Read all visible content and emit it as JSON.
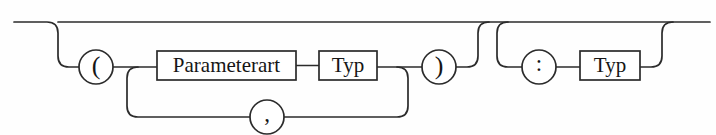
{
  "diagram": {
    "kind": "railroad-syntax-diagram",
    "language": "de",
    "ink_color": "#2b2b2b",
    "background_color": "#fefefe",
    "nodes": [
      {
        "id": "open-paren",
        "shape": "circle",
        "type": "terminal",
        "label": "(",
        "cx": 96,
        "cy": 67,
        "r": 17
      },
      {
        "id": "parameterart",
        "shape": "box",
        "type": "nonterminal",
        "label": "Parameterart",
        "x": 157,
        "y": 51,
        "width": 139,
        "height": 29
      },
      {
        "id": "typ-param",
        "shape": "box",
        "type": "nonterminal",
        "label": "Typ",
        "x": 319,
        "y": 51,
        "width": 58,
        "height": 29
      },
      {
        "id": "close-paren",
        "shape": "circle",
        "type": "terminal",
        "label": ")",
        "cx": 439,
        "cy": 67,
        "r": 17
      },
      {
        "id": "comma",
        "shape": "circle",
        "type": "terminal",
        "label": ",",
        "cx": 267,
        "cy": 117,
        "r": 17
      },
      {
        "id": "colon",
        "shape": "circle",
        "type": "terminal",
        "label": ":",
        "cx": 539,
        "cy": 67,
        "r": 17
      },
      {
        "id": "typ-return",
        "shape": "box",
        "type": "nonterminal",
        "label": "Typ",
        "x": 580,
        "y": 51,
        "width": 60,
        "height": 29
      }
    ],
    "paths": {
      "main_line_y": 22,
      "branch_line_y": 67,
      "loop_line_y": 117,
      "entry_x": 14,
      "exit_x": 710,
      "descender_open_paren_x": 58,
      "riser_close_paren_x": 478,
      "descender_colon_x": 497,
      "riser_typ_return_x": 662,
      "loop_left_x": 138,
      "loop_right_x": 397,
      "corner_radius": 11
    },
    "labels": {
      "open_paren": "(",
      "close_paren": ")",
      "comma": ",",
      "colon": ":",
      "parameterart": "Parameterart",
      "typ_param": "Typ",
      "typ_return": "Typ"
    }
  }
}
